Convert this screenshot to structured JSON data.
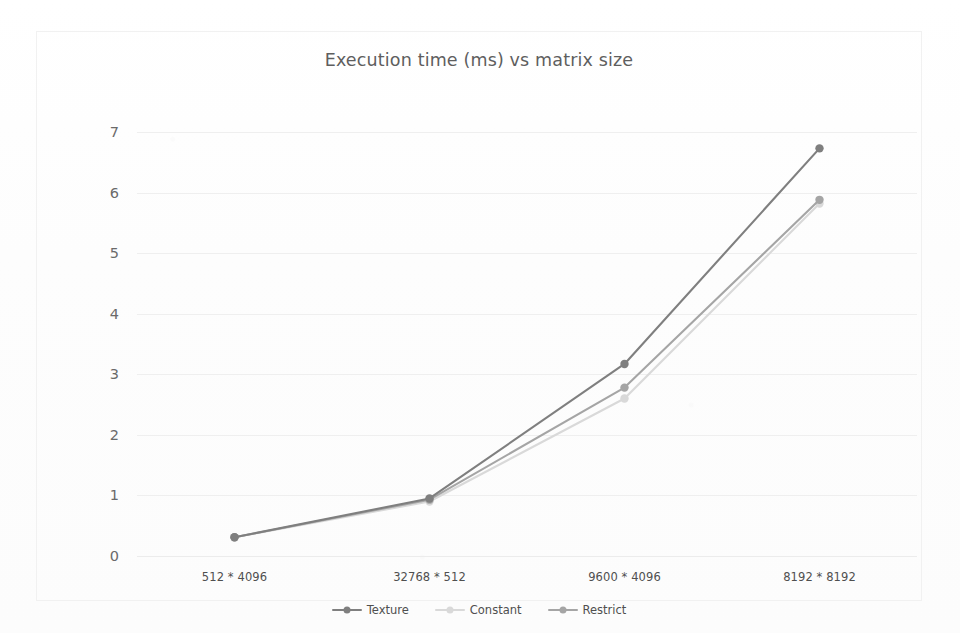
{
  "chart_data": {
    "type": "line",
    "title": "Execution time (ms) vs matrix size",
    "xlabel": "",
    "ylabel": "",
    "categories": [
      "512 * 4096",
      "32768 * 512",
      "9600 * 4096",
      "8192 * 8192"
    ],
    "series": [
      {
        "name": "Texture",
        "color": "#7f7f7f",
        "values": [
          0.31,
          0.95,
          3.17,
          6.73
        ]
      },
      {
        "name": "Constant",
        "color": "#d9d9d9",
        "values": [
          0.31,
          0.9,
          2.6,
          5.82
        ]
      },
      {
        "name": "Restrict",
        "color": "#a5a5a5",
        "values": [
          0.31,
          0.93,
          2.78,
          5.88
        ]
      }
    ],
    "ylim": [
      0,
      7
    ],
    "yticks": [
      0,
      1,
      2,
      3,
      4,
      5,
      6,
      7
    ],
    "ytick_labels": [
      "0",
      "1",
      "2",
      "3",
      "4",
      "5",
      "6",
      "7"
    ],
    "grid": true,
    "legend_position": "bottom",
    "markers": true
  },
  "legend": {
    "items": [
      {
        "label": "Texture"
      },
      {
        "label": "Constant"
      },
      {
        "label": "Restrict"
      }
    ]
  },
  "colors": {
    "title": "#5e5e5e",
    "gridline": "#efefef",
    "tick_text": "#4f4f4f",
    "texture": "#7f7f7f",
    "constant": "#d9d9d9",
    "restrict": "#a5a5a5"
  }
}
